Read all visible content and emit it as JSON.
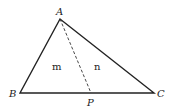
{
  "diagram": {
    "vertices": {
      "A": {
        "label": "A",
        "x": 60,
        "y": 19
      },
      "B": {
        "label": "B",
        "x": 20,
        "y": 93
      },
      "C": {
        "label": "C",
        "x": 154,
        "y": 93
      },
      "P": {
        "label": "P",
        "x": 91,
        "y": 93
      }
    },
    "regions": {
      "left": {
        "label": "m"
      },
      "right": {
        "label": "n"
      }
    },
    "segments": [
      {
        "from": "A",
        "to": "B",
        "style": "solid"
      },
      {
        "from": "A",
        "to": "C",
        "style": "solid"
      },
      {
        "from": "B",
        "to": "C",
        "style": "solid"
      },
      {
        "from": "A",
        "to": "P",
        "style": "dashed"
      }
    ],
    "colors": {
      "stroke": "#222222",
      "background": "#ffffff"
    }
  }
}
